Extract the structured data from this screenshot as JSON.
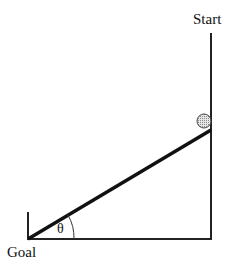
{
  "diagram": {
    "labels": {
      "start": "Start",
      "goal": "Goal",
      "angle": "θ"
    },
    "colors": {
      "line": "#111111",
      "ball_fill": "#cfcfcf",
      "ball_stroke": "#555555",
      "background": "#ffffff"
    }
  }
}
